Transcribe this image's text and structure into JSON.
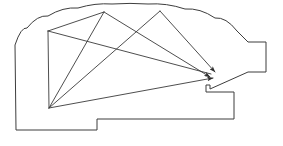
{
  "figure": {
    "background_color": "#ffffff",
    "outline_color": "#3d3d3d",
    "ray_color": "#3a3a3a",
    "arrowhead_color": "#2e2e2e",
    "width": 283,
    "height": 146
  },
  "chart_data": {
    "type": "line",
    "xlabel": "",
    "ylabel": "",
    "xlim": [
      0,
      283
    ],
    "ylim": [
      0,
      146
    ],
    "grid": false,
    "legend_position": "none",
    "outline_label": "enclosure-outline",
    "outline_points": [
      [
        15,
        45
      ],
      [
        27,
        28
      ],
      [
        48,
        16
      ],
      [
        78,
        8
      ],
      [
        112,
        4
      ],
      [
        148,
        4
      ],
      [
        185,
        9
      ],
      [
        215,
        18
      ],
      [
        237,
        31
      ],
      [
        248,
        42
      ],
      [
        266,
        42
      ],
      [
        266,
        72
      ],
      [
        248,
        72
      ],
      [
        210,
        89
      ],
      [
        210,
        85
      ],
      [
        206,
        85
      ],
      [
        206,
        92
      ],
      [
        234,
        92
      ],
      [
        234,
        119
      ],
      [
        97,
        119
      ],
      [
        97,
        130
      ],
      [
        16,
        130
      ],
      [
        15,
        45
      ]
    ],
    "rays": [
      {
        "name": "ray-top-left-to-target",
        "from": [
          104,
          12
        ],
        "to": [
          210,
          77
        ],
        "has_arrowhead": true
      },
      {
        "name": "ray-top-right-to-target",
        "from": [
          160,
          11
        ],
        "to": [
          215,
          72
        ],
        "has_arrowhead": true
      },
      {
        "name": "ray-bottom-to-target",
        "from": [
          49,
          108
        ],
        "to": [
          213,
          78
        ],
        "has_arrowhead": true
      },
      {
        "name": "ray-top-left-to-bottom",
        "from": [
          104,
          12
        ],
        "to": [
          49,
          108
        ],
        "has_arrowhead": false
      },
      {
        "name": "ray-top-right-to-bottom",
        "from": [
          160,
          11
        ],
        "to": [
          49,
          108
        ],
        "has_arrowhead": false
      },
      {
        "name": "ray-left-vertex-to-bottom",
        "from": [
          48,
          31
        ],
        "to": [
          49,
          108
        ],
        "has_arrowhead": false
      },
      {
        "name": "ray-left-vertex-to-top-left",
        "from": [
          48,
          31
        ],
        "to": [
          104,
          12
        ],
        "has_arrowhead": false
      },
      {
        "name": "ray-left-vertex-to-target",
        "from": [
          48,
          31
        ],
        "to": [
          211,
          74
        ],
        "has_arrowhead": false
      }
    ],
    "vertices": [
      {
        "name": "vertex-upper-left-arc",
        "point": [
          48,
          31
        ]
      },
      {
        "name": "vertex-top-left",
        "point": [
          104,
          12
        ]
      },
      {
        "name": "vertex-top-right",
        "point": [
          160,
          11
        ]
      },
      {
        "name": "vertex-bottom-origin",
        "point": [
          49,
          108
        ]
      },
      {
        "name": "vertex-target-convergence",
        "point": [
          212,
          76
        ]
      }
    ]
  }
}
